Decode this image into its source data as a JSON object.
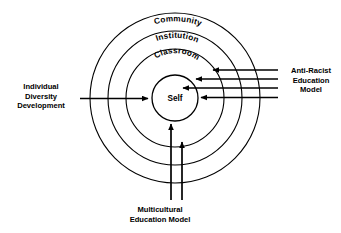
{
  "diagram": {
    "stroke_color": "#000000",
    "background_color": "#ffffff",
    "rings": [
      {
        "id": "community",
        "label": "Community",
        "radius": 85,
        "label_radius": 72
      },
      {
        "id": "institution",
        "label": "Institution",
        "radius": 67,
        "label_radius": 55
      },
      {
        "id": "classroom",
        "label": "Classroom",
        "radius": 49,
        "label_radius": 38
      },
      {
        "id": "self",
        "label": "Self",
        "radius": 23,
        "label_radius": 0
      }
    ],
    "center": {
      "x": 175,
      "y": 98
    },
    "arrows": {
      "left": {
        "label_lines": [
          "Individual",
          "Diversity",
          "Development"
        ],
        "label_text": "Individual Diversity Development",
        "direction": "right",
        "count": 1,
        "targets": [
          "self"
        ]
      },
      "right": {
        "label_lines": [
          "Anti-Racist",
          "Education",
          "Model"
        ],
        "label_text": "Anti-Racist Education Model",
        "direction": "left",
        "count": 4,
        "targets": [
          "institution",
          "classroom",
          "self",
          "self"
        ]
      },
      "bottom": {
        "label_lines": [
          "Multicultural",
          "Education Model"
        ],
        "label_text": "Multicultural Education Model",
        "direction": "up",
        "count": 2,
        "targets": [
          "self",
          "classroom"
        ]
      }
    }
  }
}
